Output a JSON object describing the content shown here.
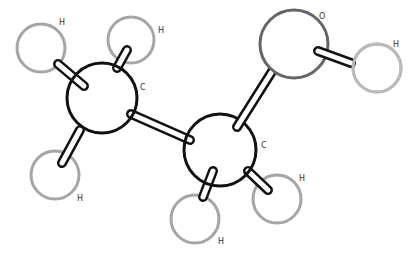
{
  "diagram": {
    "colors": {
      "carbon_stroke": "#111111",
      "oxygen_stroke": "#666666",
      "hydrogen_stroke": "#a6a6a6",
      "hydroxyl_h_stroke": "#bbbbbb",
      "bond_stroke": "#111111",
      "fill": "#ffffff"
    },
    "atoms": [
      {
        "id": "C1",
        "element": "C",
        "label": "C",
        "cx": 102,
        "cy": 98,
        "r": 35
      },
      {
        "id": "C2",
        "element": "C",
        "label": "C",
        "cx": 220,
        "cy": 150,
        "r": 36
      },
      {
        "id": "O",
        "element": "O",
        "label": "O",
        "cx": 294,
        "cy": 44,
        "r": 34
      },
      {
        "id": "H1",
        "element": "H",
        "label": "H",
        "cx": 41,
        "cy": 48,
        "r": 24
      },
      {
        "id": "H2",
        "element": "H",
        "label": "H",
        "cx": 131,
        "cy": 40,
        "r": 23
      },
      {
        "id": "H3",
        "element": "H",
        "label": "H",
        "cx": 55,
        "cy": 175,
        "r": 24
      },
      {
        "id": "H4",
        "element": "H",
        "label": "H",
        "cx": 195,
        "cy": 219,
        "r": 24
      },
      {
        "id": "H5",
        "element": "H",
        "label": "H",
        "cx": 277,
        "cy": 199,
        "r": 24
      },
      {
        "id": "H6",
        "element": "H",
        "label": "H",
        "cx": 377,
        "cy": 68,
        "r": 24
      }
    ],
    "labels": {
      "C1": "C",
      "C2": "C",
      "O": "O",
      "H1": "H",
      "H2": "H",
      "H3": "H",
      "H4": "H",
      "H5": "H",
      "H6": "H"
    },
    "bonds": [
      {
        "from": "C1",
        "to": "C2"
      },
      {
        "from": "C2",
        "to": "O"
      },
      {
        "from": "O",
        "to": "H6"
      },
      {
        "from": "C1",
        "to": "H1"
      },
      {
        "from": "C1",
        "to": "H2"
      },
      {
        "from": "C1",
        "to": "H3"
      },
      {
        "from": "C2",
        "to": "H4"
      },
      {
        "from": "C2",
        "to": "H5"
      }
    ]
  }
}
